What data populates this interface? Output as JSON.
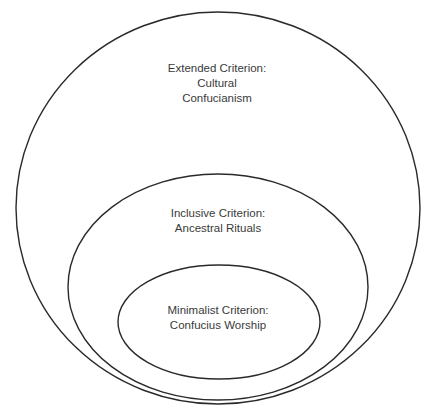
{
  "diagram": {
    "type": "nested-ellipses",
    "stroke_color": "#2a2a2a",
    "text_color": "#3a3a3a",
    "outer": {
      "lines": [
        "Extended Criterion:",
        "Cultural",
        "Confucianism"
      ]
    },
    "middle": {
      "lines": [
        "Inclusive Criterion:",
        "Ancestral Rituals"
      ]
    },
    "inner": {
      "lines": [
        "Minimalist Criterion:",
        "Confucius Worship"
      ]
    }
  }
}
